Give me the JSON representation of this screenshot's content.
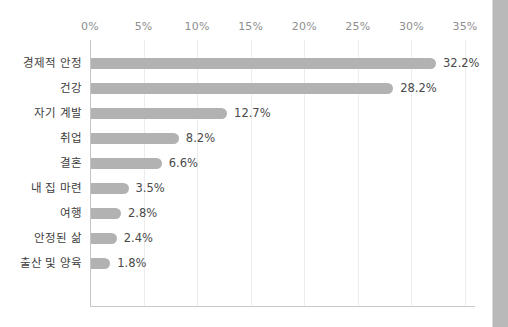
{
  "chart_data": {
    "type": "bar",
    "orientation": "horizontal",
    "title": "",
    "subtitle": "",
    "xlabel": "",
    "ylabel": "",
    "xlim": [
      0,
      35
    ],
    "grid": true,
    "legend": null,
    "value_suffix": "%",
    "xtick_labels": [
      "0%",
      "5%",
      "10%",
      "15%",
      "20%",
      "25%",
      "30%",
      "35%"
    ],
    "xticks": [
      0,
      5,
      10,
      15,
      20,
      25,
      30,
      35
    ],
    "categories": [
      "경제적 안정",
      "건강",
      "자기 계발",
      "취업",
      "결혼",
      "내 집 마련",
      "여행",
      "안정된 삶",
      "출산 및 양육"
    ],
    "values": [
      32.2,
      28.2,
      12.7,
      8.2,
      6.6,
      3.5,
      2.8,
      2.4,
      1.8
    ],
    "value_labels": [
      "32.2%",
      "28.2%",
      "12.7%",
      "8.2%",
      "6.6%",
      "3.5%",
      "2.8%",
      "2.4%",
      "1.8%"
    ],
    "colors": {
      "bar": "#b2b2b2",
      "gridline": "#ececec",
      "axis": "#c4c4c4",
      "tick_text": "#8e8e8e",
      "category_text": "#3d3d3d",
      "value_text": "#4a4a4a",
      "background": "#ffffff",
      "gutter": "#b9b9b9"
    }
  }
}
